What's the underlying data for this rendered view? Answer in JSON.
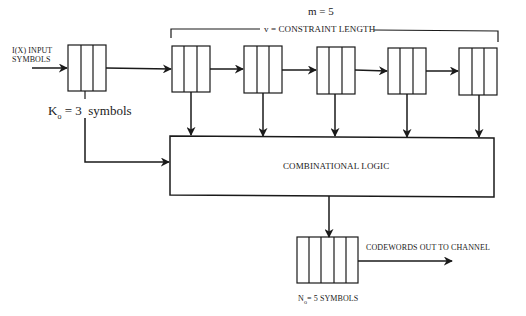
{
  "diagram": {
    "input_label": [
      "I(X) INPUT",
      "SYMBOLS"
    ],
    "input_register": {
      "cells": 3,
      "label_prefix": "K",
      "label_sub": "o",
      "label_rest": " = 3  symbols"
    },
    "shift_register": {
      "m_label": "m = 5",
      "constraint_label": "v = CONSTRAINT LENGTH",
      "stages": 5,
      "cells_per_stage": 3
    },
    "logic_block": {
      "label": "COMBINATIONAL LOGIC"
    },
    "output_register": {
      "cells": 5,
      "label_prefix": "N",
      "label_sub": "o",
      "label_rest": "= 5 SYMBOLS"
    },
    "output_label": "CODEWORDS OUT TO CHANNEL",
    "colors": {
      "stroke": "#1a1a1a",
      "background": "#ffffff"
    }
  }
}
